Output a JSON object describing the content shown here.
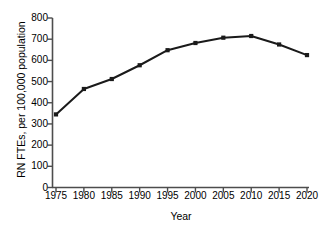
{
  "chart_data": {
    "type": "line",
    "title": "",
    "xlabel": "Year",
    "ylabel": "RN FTEs, per 100,000 population",
    "x": [
      1975,
      1980,
      1985,
      1990,
      1995,
      2000,
      2005,
      2010,
      2015,
      2020
    ],
    "values": [
      345,
      465,
      512,
      577,
      648,
      682,
      707,
      715,
      675,
      625
    ],
    "categories": [
      "1975",
      "1980",
      "1985",
      "1990",
      "1995",
      "2000",
      "2005",
      "2010",
      "2015",
      "2020"
    ],
    "xlim": [
      1975,
      2020
    ],
    "ylim": [
      0,
      800
    ],
    "yticks": [
      0,
      100,
      200,
      300,
      400,
      500,
      600,
      700,
      800
    ],
    "ytick_labels": [
      "0",
      "100",
      "200",
      "300",
      "400",
      "500",
      "600",
      "700",
      "800"
    ],
    "xticks": [
      1975,
      1980,
      1985,
      1990,
      1995,
      2000,
      2005,
      2010,
      2015,
      2020
    ],
    "xtick_labels": [
      "1975",
      "1980",
      "1985",
      "1990",
      "1995",
      "2000",
      "2005",
      "2010",
      "2015",
      "2020"
    ],
    "grid": false,
    "legend": null,
    "series": [
      {
        "name": "RN FTEs per 100,000 population",
        "values": [
          345,
          465,
          512,
          577,
          648,
          682,
          707,
          715,
          675,
          625
        ],
        "color": "#1a1a1a",
        "marker": "square",
        "line_width": 2
      }
    ],
    "colors": {
      "line": "#1a1a1a",
      "marker": "#1a1a1a",
      "axis": "#4d4d4d",
      "text": "#000000",
      "background": "#ffffff"
    }
  }
}
